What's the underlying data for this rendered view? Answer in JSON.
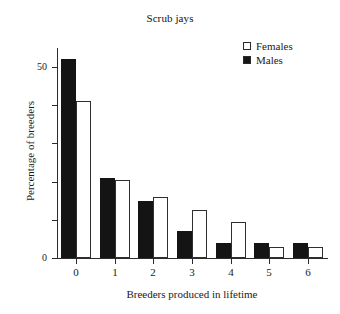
{
  "chart_data": {
    "type": "bar",
    "title": "Scrub jays",
    "xlabel": "Breeders produced in lifetime",
    "ylabel": "Percentage of breeders",
    "categories": [
      "0",
      "1",
      "2",
      "3",
      "4",
      "5",
      "6"
    ],
    "series": [
      {
        "name": "Males",
        "values": [
          52,
          21,
          15,
          7,
          4,
          4,
          4
        ],
        "color": "#141414",
        "style": "filled"
      },
      {
        "name": "Females",
        "values": [
          41,
          20.5,
          16,
          12.5,
          9.5,
          3,
          3
        ],
        "color": "#ffffff",
        "style": "hollow"
      }
    ],
    "series_draw_order": [
      "Males",
      "Females"
    ],
    "ylim": [
      0,
      55
    ],
    "yticks": [
      0,
      10,
      20,
      30,
      40,
      50
    ],
    "ytick_labels": [
      "0",
      "",
      "",
      "",
      "",
      "50"
    ],
    "grid": false,
    "legend_position": "top-right"
  },
  "legend": {
    "items": [
      {
        "label": "Females",
        "style": "hollow"
      },
      {
        "label": "Males",
        "style": "filled"
      }
    ]
  }
}
